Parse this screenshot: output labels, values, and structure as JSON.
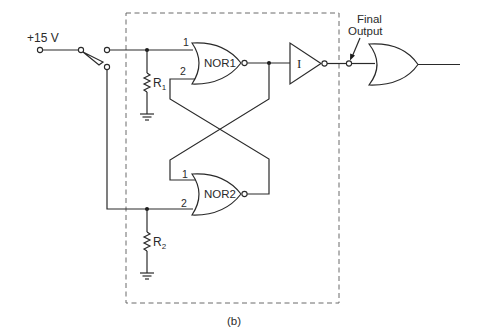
{
  "diagram": {
    "caption": "(b)",
    "supply": {
      "label": "+15 V"
    },
    "final_output": {
      "line1": "Final",
      "line2": "Output"
    },
    "gates": {
      "nor1": {
        "label": "NOR1",
        "pin1": "1",
        "pin2": "2"
      },
      "nor2": {
        "label": "NOR2",
        "pin1": "1",
        "pin2": "2"
      },
      "inverter": {
        "label": "I"
      },
      "or_gate": {
        "label": ""
      }
    },
    "resistors": {
      "r1": {
        "label": "R",
        "sub": "1"
      },
      "r2": {
        "label": "R",
        "sub": "2"
      }
    },
    "colors": {
      "line": "#2a2a2a",
      "dashed_box": "#6a6a6a",
      "background": "#ffffff"
    }
  }
}
